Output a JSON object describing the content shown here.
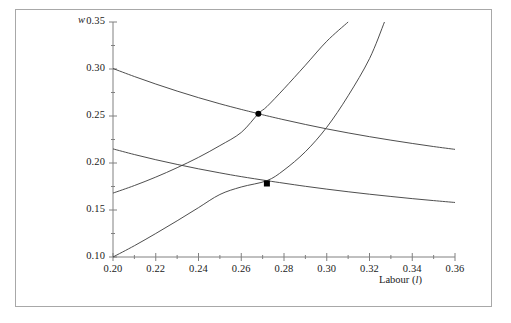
{
  "figure": {
    "frame_color": "#a8a8a8",
    "background": "#ffffff",
    "curve_color": "#3a3a3a",
    "marker_color": "#000000"
  },
  "axes": {
    "y_axis_title": "w",
    "x_axis_title_text": "Labour (",
    "x_axis_title_symbol": "l",
    "x_axis_title_close": ")",
    "y_tick_labels": [
      "0.35",
      "0.30",
      "0.25",
      "0.20",
      "0.15",
      "0.10"
    ],
    "y_tick_values": [
      0.35,
      0.3,
      0.25,
      0.2,
      0.15,
      0.1
    ],
    "x_tick_labels": [
      "0.20",
      "0.22",
      "0.24",
      "0.26",
      "0.28",
      "0.30",
      "0.32",
      "0.34",
      "0.36"
    ],
    "x_tick_values": [
      0.2,
      0.22,
      0.24,
      0.26,
      0.28,
      0.3,
      0.32,
      0.34,
      0.36
    ]
  },
  "chart_data": {
    "type": "line",
    "title": "",
    "xlabel": "Labour (l)",
    "ylabel": "w",
    "xlim": [
      0.2,
      0.36
    ],
    "ylim": [
      0.1,
      0.35
    ],
    "grid": false,
    "legend": "none",
    "x_major_ticks": [
      0.2,
      0.22,
      0.24,
      0.26,
      0.28,
      0.3,
      0.32,
      0.34,
      0.36
    ],
    "x_minor_ticks": [
      0.21,
      0.23,
      0.25,
      0.27,
      0.29,
      0.31,
      0.33,
      0.35
    ],
    "y_major_ticks": [
      0.1,
      0.15,
      0.2,
      0.25,
      0.3,
      0.35
    ],
    "y_minor_ticks": [
      0.125,
      0.175,
      0.225,
      0.275,
      0.325
    ],
    "series": [
      {
        "name": "labour demand (upper)",
        "shape": "decreasing convex",
        "points": [
          [
            0.2,
            0.3005
          ],
          [
            0.21,
            0.292
          ],
          [
            0.22,
            0.284
          ],
          [
            0.23,
            0.2765
          ],
          [
            0.24,
            0.2695
          ],
          [
            0.25,
            0.263
          ],
          [
            0.26,
            0.257
          ],
          [
            0.268,
            0.2525
          ],
          [
            0.27,
            0.2513
          ],
          [
            0.28,
            0.246
          ],
          [
            0.29,
            0.241
          ],
          [
            0.3,
            0.2363
          ],
          [
            0.31,
            0.232
          ],
          [
            0.32,
            0.228
          ],
          [
            0.33,
            0.2243
          ],
          [
            0.34,
            0.2208
          ],
          [
            0.35,
            0.2175
          ],
          [
            0.36,
            0.2145
          ]
        ]
      },
      {
        "name": "labour demand (lower)",
        "shape": "decreasing convex",
        "points": [
          [
            0.2,
            0.215
          ],
          [
            0.21,
            0.209
          ],
          [
            0.22,
            0.2035
          ],
          [
            0.23,
            0.1985
          ],
          [
            0.24,
            0.1938
          ],
          [
            0.25,
            0.1895
          ],
          [
            0.26,
            0.1855
          ],
          [
            0.272,
            0.1812
          ],
          [
            0.28,
            0.1785
          ],
          [
            0.29,
            0.1752
          ],
          [
            0.3,
            0.1722
          ],
          [
            0.31,
            0.1694
          ],
          [
            0.32,
            0.1668
          ],
          [
            0.33,
            0.1644
          ],
          [
            0.34,
            0.1621
          ],
          [
            0.35,
            0.16
          ],
          [
            0.36,
            0.158
          ]
        ]
      },
      {
        "name": "labour supply (left)",
        "shape": "increasing convex",
        "points": [
          [
            0.2,
            0.168
          ],
          [
            0.21,
            0.176
          ],
          [
            0.22,
            0.185
          ],
          [
            0.23,
            0.195
          ],
          [
            0.24,
            0.206
          ],
          [
            0.25,
            0.2185
          ],
          [
            0.26,
            0.2325
          ],
          [
            0.268,
            0.2525
          ],
          [
            0.272,
            0.26
          ],
          [
            0.28,
            0.279
          ],
          [
            0.29,
            0.304
          ],
          [
            0.3,
            0.3295
          ],
          [
            0.31,
            0.35
          ]
        ]
      },
      {
        "name": "labour supply (right)",
        "shape": "increasing convex",
        "points": [
          [
            0.2,
            0.1
          ],
          [
            0.21,
            0.112
          ],
          [
            0.22,
            0.125
          ],
          [
            0.23,
            0.1385
          ],
          [
            0.24,
            0.1525
          ],
          [
            0.25,
            0.1665
          ],
          [
            0.26,
            0.1745
          ],
          [
            0.272,
            0.1812
          ],
          [
            0.28,
            0.1925
          ],
          [
            0.29,
            0.212
          ],
          [
            0.3,
            0.238
          ],
          [
            0.31,
            0.2715
          ],
          [
            0.32,
            0.311
          ],
          [
            0.327,
            0.35
          ]
        ]
      }
    ],
    "markers": [
      {
        "name": "equilibrium-upper",
        "x": 0.268,
        "y": 0.2525,
        "style": "filled circle"
      },
      {
        "name": "equilibrium-lower",
        "x": 0.272,
        "y": 0.1782,
        "style": "filled square"
      }
    ]
  }
}
